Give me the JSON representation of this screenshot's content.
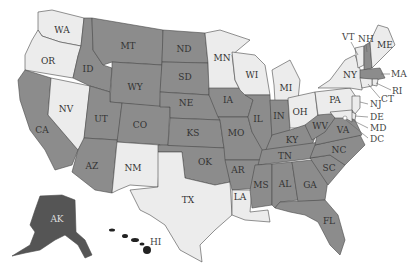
{
  "map": {
    "type": "us-states-choropleth",
    "colors": {
      "selected": "#8c8c8c",
      "unselected": "#ececec",
      "alaska": "#555555",
      "hawaii": "#222222",
      "border": "#4a4a4a",
      "background": "#ffffff"
    },
    "legend": null,
    "states": [
      {
        "code": "WA",
        "label": "WA",
        "selected": false
      },
      {
        "code": "OR",
        "label": "OR",
        "selected": false
      },
      {
        "code": "CA",
        "label": "CA",
        "selected": true
      },
      {
        "code": "NV",
        "label": "NV",
        "selected": false
      },
      {
        "code": "ID",
        "label": "ID",
        "selected": true
      },
      {
        "code": "MT",
        "label": "MT",
        "selected": true
      },
      {
        "code": "WY",
        "label": "WY",
        "selected": true
      },
      {
        "code": "UT",
        "label": "UT",
        "selected": true
      },
      {
        "code": "AZ",
        "label": "AZ",
        "selected": true
      },
      {
        "code": "CO",
        "label": "CO",
        "selected": true
      },
      {
        "code": "NM",
        "label": "NM",
        "selected": false
      },
      {
        "code": "ND",
        "label": "ND",
        "selected": true
      },
      {
        "code": "SD",
        "label": "SD",
        "selected": true
      },
      {
        "code": "NE",
        "label": "NE",
        "selected": true
      },
      {
        "code": "KS",
        "label": "KS",
        "selected": true
      },
      {
        "code": "OK",
        "label": "OK",
        "selected": true
      },
      {
        "code": "TX",
        "label": "TX",
        "selected": false
      },
      {
        "code": "MN",
        "label": "MN",
        "selected": false
      },
      {
        "code": "IA",
        "label": "IA",
        "selected": true
      },
      {
        "code": "MO",
        "label": "MO",
        "selected": true
      },
      {
        "code": "AR",
        "label": "AR",
        "selected": true
      },
      {
        "code": "LA",
        "label": "LA",
        "selected": false
      },
      {
        "code": "WI",
        "label": "WI",
        "selected": false
      },
      {
        "code": "IL",
        "label": "IL",
        "selected": true
      },
      {
        "code": "MI",
        "label": "MI",
        "selected": false
      },
      {
        "code": "IN",
        "label": "IN",
        "selected": true
      },
      {
        "code": "OH",
        "label": "OH",
        "selected": false
      },
      {
        "code": "KY",
        "label": "KY",
        "selected": true
      },
      {
        "code": "TN",
        "label": "TN",
        "selected": true
      },
      {
        "code": "MS",
        "label": "MS",
        "selected": true
      },
      {
        "code": "AL",
        "label": "AL",
        "selected": true
      },
      {
        "code": "GA",
        "label": "GA",
        "selected": true
      },
      {
        "code": "FL",
        "label": "FL",
        "selected": true
      },
      {
        "code": "SC",
        "label": "SC",
        "selected": true
      },
      {
        "code": "NC",
        "label": "NC",
        "selected": true
      },
      {
        "code": "VA",
        "label": "VA",
        "selected": true
      },
      {
        "code": "WV",
        "label": "WV",
        "selected": true
      },
      {
        "code": "PA",
        "label": "PA",
        "selected": false
      },
      {
        "code": "NY",
        "label": "NY",
        "selected": false
      },
      {
        "code": "VT",
        "label": "VT",
        "selected": false
      },
      {
        "code": "NH",
        "label": "NH",
        "selected": true
      },
      {
        "code": "ME",
        "label": "ME",
        "selected": false
      },
      {
        "code": "MA",
        "label": "MA",
        "selected": true
      },
      {
        "code": "RI",
        "label": "RI",
        "selected": false
      },
      {
        "code": "CT",
        "label": "CT",
        "selected": false
      },
      {
        "code": "NJ",
        "label": "NJ",
        "selected": false
      },
      {
        "code": "DE",
        "label": "DE",
        "selected": false
      },
      {
        "code": "MD",
        "label": "MD",
        "selected": false
      },
      {
        "code": "DC",
        "label": "DC",
        "selected": false
      },
      {
        "code": "AK",
        "label": "AK",
        "selected": true
      },
      {
        "code": "HI",
        "label": "HI",
        "selected": true
      }
    ],
    "labels": {
      "WA": "WA",
      "OR": "OR",
      "CA": "CA",
      "NV": "NV",
      "ID": "ID",
      "MT": "MT",
      "WY": "WY",
      "UT": "UT",
      "AZ": "AZ",
      "CO": "CO",
      "NM": "NM",
      "ND": "ND",
      "SD": "SD",
      "NE": "NE",
      "KS": "KS",
      "OK": "OK",
      "TX": "TX",
      "MN": "MN",
      "IA": "IA",
      "MO": "MO",
      "AR": "AR",
      "LA": "LA",
      "WI": "WI",
      "IL": "IL",
      "MI": "MI",
      "IN": "IN",
      "OH": "OH",
      "KY": "KY",
      "TN": "TN",
      "MS": "MS",
      "AL": "AL",
      "GA": "GA",
      "FL": "FL",
      "SC": "SC",
      "NC": "NC",
      "VA": "VA",
      "WV": "WV",
      "PA": "PA",
      "NY": "NY",
      "VT": "VT",
      "NH": "NH",
      "ME": "ME",
      "MA": "MA",
      "RI": "RI",
      "CT": "CT",
      "NJ": "NJ",
      "DE": "DE",
      "MD": "MD",
      "DC": "DC",
      "AK": "AK",
      "HI": "HI"
    }
  }
}
